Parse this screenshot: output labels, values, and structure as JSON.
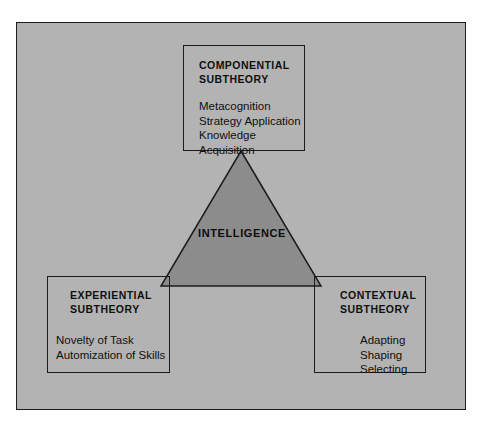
{
  "diagram": {
    "background_color": "#b3b3b3",
    "border_color": "#1c1c1c",
    "triangle_fill": "#8c8c8c",
    "center": {
      "label": "INTELLIGENCE"
    },
    "boxes": [
      {
        "id": "componential",
        "header": "COMPONENTIAL\nSUBTHEORY",
        "body": "Metacognition\nStrategy Application\nKnowledge Acquisition"
      },
      {
        "id": "experiential",
        "header": "EXPERIENTIAL\nSUBTHEORY",
        "body": "Novelty of Task\nAutomization of Skills"
      },
      {
        "id": "contextual",
        "header": "CONTEXTUAL\nSUBTHEORY",
        "body": "Adapting\nShaping\nSelecting"
      }
    ]
  }
}
